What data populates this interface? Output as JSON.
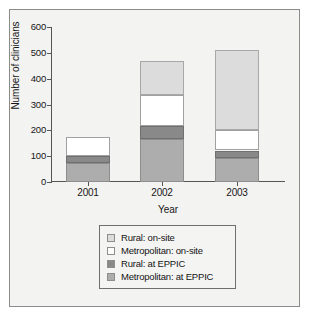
{
  "chart_data": {
    "type": "bar",
    "title": "",
    "subtitle": "",
    "xlabel": "Year",
    "ylabel": "Number of clinicians",
    "categories": [
      "2001",
      "2002",
      "2003"
    ],
    "ylim": [
      0,
      600
    ],
    "yticks": [
      0,
      100,
      200,
      300,
      400,
      500,
      600
    ],
    "ytick_labels": [
      "0",
      "100",
      "200",
      "300",
      "400",
      "500",
      "600"
    ],
    "grid": false,
    "stacked": true,
    "stack_order_bottom_to_top": [
      "Metropolitan: at EPPIC",
      "Rural: at EPPIC",
      "Metropolitan: on-site",
      "Rural: on-site"
    ],
    "legend_position": "below-plot",
    "series": [
      {
        "name": "Rural: on-site",
        "color": "#dcdcdc",
        "values": [
          0,
          133,
          310
        ]
      },
      {
        "name": "Metropolitan: on-site",
        "color": "#ffffff",
        "values": [
          74,
          121,
          78
        ]
      },
      {
        "name": "Rural: at EPPIC",
        "color": "#898989",
        "values": [
          27,
          51,
          28
        ]
      },
      {
        "name": "Metropolitan: at EPPIC",
        "color": "#adadad",
        "values": [
          75,
          165,
          94
        ]
      }
    ],
    "totals": [
      176,
      470,
      510
    ]
  },
  "legend": {
    "items": [
      {
        "label": "Rural: on-site",
        "swatch": "s-rural-onsite"
      },
      {
        "label": "Metropolitan: on-site",
        "swatch": "s-metro-onsite"
      },
      {
        "label": "Rural: at EPPIC",
        "swatch": "s-rural-eppic"
      },
      {
        "label": "Metropolitan: at EPPIC",
        "swatch": "s-metro-eppic"
      }
    ]
  }
}
